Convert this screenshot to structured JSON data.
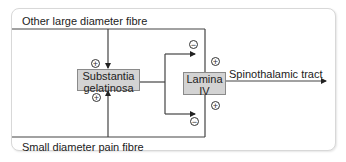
{
  "diagram": {
    "inputs": {
      "top_fibre": "Other large diameter fibre",
      "bottom_fibre": "Small diameter pain fibre"
    },
    "nodes": {
      "substantia_gelatinosa": {
        "line1": "Substantia",
        "line2": "gelatinosa"
      },
      "lamina_iv": {
        "line1": "Lamina",
        "line2": "IV"
      }
    },
    "output": "Spinothalamic tract",
    "signs": {
      "top_to_sg": "+",
      "bottom_to_sg": "+",
      "sg_to_lamina_upper": "−",
      "sg_to_lamina_lower": "−",
      "top_to_lamina": "+",
      "bottom_to_lamina": "+"
    },
    "colors": {
      "line": "#333333",
      "box_fill": "#d3d3d3",
      "frame": "#d8d8d8"
    }
  }
}
